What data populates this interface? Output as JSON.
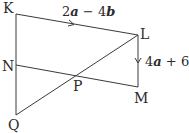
{
  "diagram": {
    "points": {
      "K": {
        "label": "K",
        "x": 16,
        "y": 14
      },
      "L": {
        "label": "L",
        "x": 138,
        "y": 35
      },
      "M": {
        "label": "M",
        "x": 138,
        "y": 87
      },
      "N": {
        "label": "N",
        "x": 16,
        "y": 65
      },
      "Q": {
        "label": "Q",
        "x": 16,
        "y": 115
      },
      "P": {
        "label": "P",
        "x": 77,
        "y": 76
      }
    },
    "segments": [
      "KL",
      "LM",
      "NM",
      "KQ",
      "QL"
    ],
    "vectors": {
      "KL": {
        "coef1": "2",
        "var1": "a",
        "op": " − ",
        "coef2": "4",
        "var2": "b"
      },
      "LM": {
        "coef1": "4",
        "var1": "a",
        "op": " + ",
        "coef2": "6",
        "var2": "b"
      }
    }
  }
}
